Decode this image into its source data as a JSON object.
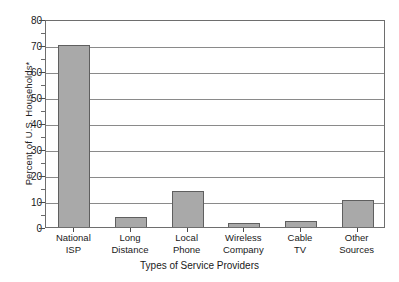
{
  "chart_data": {
    "type": "bar",
    "title": "",
    "subtitle": "",
    "xlabel": "Types of Service Providers",
    "ylabel": "Percent of U.S. Households*",
    "categories": [
      "National ISP",
      "Long Distance",
      "Local Phone",
      "Wireless Company",
      "Cable TV",
      "Other Sources"
    ],
    "category_lines": [
      [
        "National",
        "ISP"
      ],
      [
        "Long",
        "Distance"
      ],
      [
        "Local",
        "Phone"
      ],
      [
        "Wireless",
        "Company"
      ],
      [
        "Cable",
        "TV"
      ],
      [
        "Other",
        "Sources"
      ]
    ],
    "values": [
      70,
      4,
      14,
      1.5,
      2.5,
      10.5
    ],
    "ylim": [
      0,
      80
    ],
    "ytick_labels": [
      "0",
      "10",
      "20",
      "30",
      "40",
      "50",
      "60",
      "70",
      "80"
    ],
    "ytick_values": [
      0,
      10,
      20,
      30,
      40,
      50,
      60,
      70,
      80
    ],
    "grid": "horizontal",
    "legend": "none",
    "bar_color": "#a9a9a9",
    "bar_edge_color": "#5f5f5f",
    "axis_color": "#6e6e6e",
    "grid_color": "#8a8a8a",
    "background": "#ffffff"
  }
}
